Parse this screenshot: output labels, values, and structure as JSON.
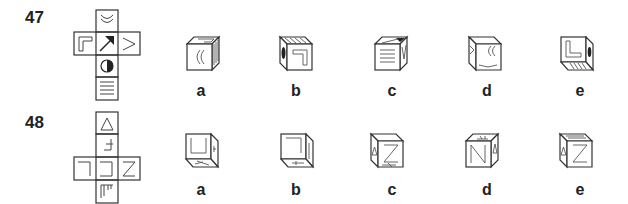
{
  "questions": [
    {
      "number": "47",
      "net": {
        "faces": [
          "double-arc",
          "corner-L-outline",
          "arrow-up-right",
          "chevron-right",
          "half-filled-circle",
          "horizontal-lines"
        ]
      },
      "options": [
        {
          "label": "a",
          "front": "double-arc",
          "top": "corner-L-outline",
          "side": "horizontal-lines"
        },
        {
          "label": "b",
          "front": "corner-L-outline-rotated",
          "top": "horizontal-lines",
          "side": "half-filled-circle"
        },
        {
          "label": "c",
          "front": "horizontal-lines",
          "top": "arrow-up-right",
          "side": "chevron-right"
        },
        {
          "label": "d",
          "front": "double-arc",
          "top": "chevron-right",
          "side": "chevron-right"
        },
        {
          "label": "e",
          "front": "corner-L-outline",
          "top": "blank",
          "side": "half-filled-circle"
        }
      ]
    },
    {
      "number": "48",
      "net": {
        "faces": [
          "triangle",
          "cross-bracket",
          "corner-bracket-left",
          "bracket-square",
          "letter-Z",
          "comb-lines"
        ]
      },
      "options": [
        {
          "label": "a",
          "front": "bracket-U",
          "top": "blank",
          "side": "cross-bracket"
        },
        {
          "label": "b",
          "front": "corner-bracket",
          "top": "blank",
          "side": "blank"
        },
        {
          "label": "c",
          "front": "letter-Z",
          "top": "blank",
          "side": "triangle"
        },
        {
          "label": "d",
          "front": "letter-N",
          "top": "cross-bracket",
          "side": "triangle"
        },
        {
          "label": "e",
          "front": "letter-Z",
          "top": "blank",
          "side": "triangle"
        }
      ]
    }
  ]
}
